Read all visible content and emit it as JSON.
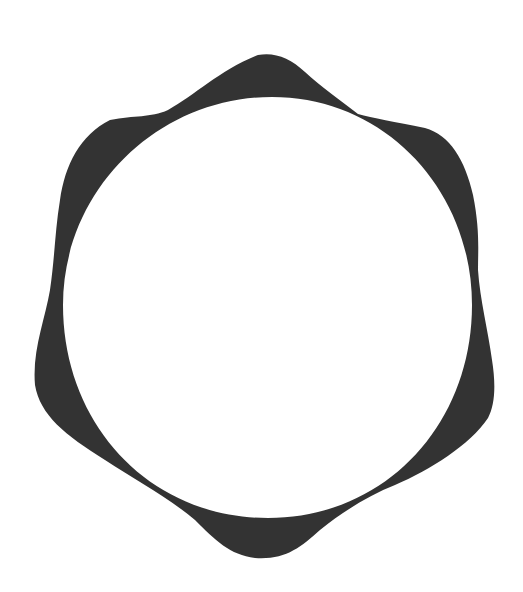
{
  "figure": {
    "shape": "six-lobed ring",
    "lobe_count": 6,
    "colors": {
      "ring_fill": "#333333",
      "background": "#ffffff",
      "inner_fill": "#ffffff"
    }
  }
}
